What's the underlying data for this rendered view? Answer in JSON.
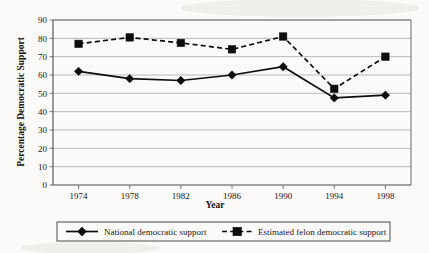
{
  "chart_data": {
    "type": "line",
    "title": "",
    "xlabel": "Year",
    "ylabel": "Percentage Democratic Support",
    "categories": [
      "1974",
      "1978",
      "1982",
      "1986",
      "1990",
      "1994",
      "1998"
    ],
    "x": [
      1974,
      1978,
      1982,
      1986,
      1990,
      1994,
      1998
    ],
    "xlim": [
      1972,
      2000
    ],
    "ylim": [
      0,
      90
    ],
    "ytick_labels": [
      "0",
      "10",
      "20",
      "30",
      "40",
      "50",
      "60",
      "70",
      "80",
      "90"
    ],
    "ytick_values": [
      0,
      10,
      20,
      30,
      40,
      50,
      60,
      70,
      80,
      90
    ],
    "grid": true,
    "legend_position": "bottom",
    "series": [
      {
        "name": "National democratic support",
        "marker": "diamond",
        "line_style": "solid",
        "color": "#0d0d0d",
        "values": [
          62,
          58,
          57,
          60,
          64.5,
          47.5,
          49
        ]
      },
      {
        "name": "Estimated felon democratic support",
        "marker": "square",
        "line_style": "dashed",
        "color": "#0d0d0d",
        "values": [
          77,
          80.5,
          77.5,
          74,
          81,
          52.5,
          70
        ]
      }
    ]
  },
  "legend": {
    "entries": [
      {
        "label": "National democratic support"
      },
      {
        "label": "Estimated felon democratic support"
      }
    ]
  }
}
